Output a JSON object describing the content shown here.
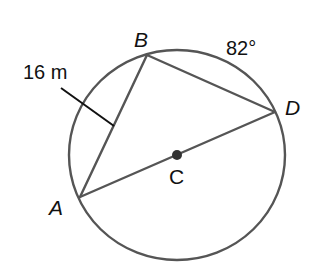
{
  "diagram": {
    "type": "circle-geometry",
    "colors": {
      "stroke": "#555555",
      "ink": "#111111",
      "center_dot": "#333333",
      "background": "#ffffff"
    },
    "circle": {
      "center_label": "C",
      "cx": 177,
      "cy": 155,
      "rx": 108,
      "ry": 105
    },
    "points": [
      {
        "name": "A",
        "x": 80,
        "y": 197
      },
      {
        "name": "B",
        "x": 147,
        "y": 55
      },
      {
        "name": "D",
        "x": 275,
        "y": 112
      },
      {
        "name": "C",
        "x": 177,
        "y": 155
      }
    ],
    "segments": [
      {
        "from": "A",
        "to": "B",
        "label": "16 m"
      },
      {
        "from": "B",
        "to": "D",
        "label": ""
      },
      {
        "from": "A",
        "to": "D",
        "label": "diameter through C"
      }
    ],
    "labels": {
      "A": "A",
      "B": "B",
      "C": "C",
      "D": "D",
      "length_AB": "16 m",
      "arc_BD": "82°"
    }
  }
}
